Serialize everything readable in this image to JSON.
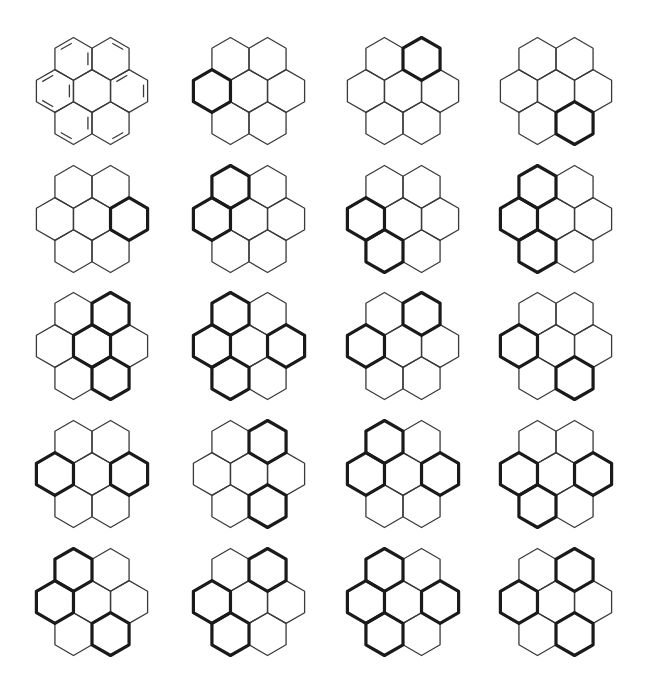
{
  "figure": {
    "grid": {
      "columns": 4,
      "rows": 5
    },
    "column_centers_x": [
      92,
      249,
      403,
      556
    ],
    "row_centers_y": [
      91,
      219,
      346,
      474,
      602
    ],
    "hex_radius": 21.4,
    "colors": {
      "thin_stroke": "#3a3a3a",
      "thick_stroke": "#1a1a1a",
      "background": "#ffffff"
    },
    "ring_names": [
      "center",
      "left",
      "right",
      "top-left",
      "top-right",
      "bottom-left",
      "bottom-right"
    ],
    "structures": [
      {
        "id": "kekule",
        "type": "kekule",
        "highlighted": [],
        "double_bonds": [
          [
            "top-left",
            5
          ],
          [
            "top-left",
            1
          ],
          [
            "top-right",
            0
          ],
          [
            "left",
            5
          ],
          [
            "left",
            3
          ],
          [
            "left",
            1
          ],
          [
            "right",
            1
          ],
          [
            "right",
            5
          ],
          [
            "bottom-left",
            3
          ],
          [
            "bottom-left",
            1
          ],
          [
            "bottom-right",
            2
          ]
        ]
      },
      {
        "id": "s2",
        "highlighted": [
          "left"
        ]
      },
      {
        "id": "s3",
        "highlighted": [
          "top-right"
        ]
      },
      {
        "id": "s4",
        "highlighted": [
          "bottom-right"
        ]
      },
      {
        "id": "s5",
        "highlighted": [
          "right"
        ]
      },
      {
        "id": "s6",
        "highlighted": [
          "top-left",
          "left"
        ]
      },
      {
        "id": "s7",
        "highlighted": [
          "left",
          "bottom-left"
        ]
      },
      {
        "id": "s8",
        "highlighted": [
          "top-left",
          "left",
          "bottom-left"
        ]
      },
      {
        "id": "s9",
        "highlighted": [
          "top-right",
          "center",
          "bottom-right"
        ]
      },
      {
        "id": "s10",
        "highlighted": [
          "top-left",
          "left",
          "bottom-left",
          "right"
        ]
      },
      {
        "id": "s11",
        "highlighted": [
          "left",
          "top-right"
        ]
      },
      {
        "id": "s12",
        "highlighted": [
          "left",
          "bottom-right"
        ]
      },
      {
        "id": "s13",
        "highlighted": [
          "left",
          "right"
        ]
      },
      {
        "id": "s14",
        "highlighted": [
          "top-right",
          "bottom-right"
        ]
      },
      {
        "id": "s15",
        "highlighted": [
          "top-left",
          "left",
          "right"
        ]
      },
      {
        "id": "s16",
        "highlighted": [
          "left",
          "bottom-left",
          "right"
        ]
      },
      {
        "id": "s17",
        "highlighted": [
          "top-left",
          "left",
          "bottom-right"
        ]
      },
      {
        "id": "s18",
        "highlighted": [
          "top-right",
          "left",
          "bottom-left"
        ]
      },
      {
        "id": "s19",
        "highlighted": [
          "top-left",
          "left",
          "bottom-left",
          "right"
        ]
      },
      {
        "id": "s20",
        "highlighted": [
          "top-right",
          "left",
          "bottom-right"
        ]
      }
    ]
  }
}
